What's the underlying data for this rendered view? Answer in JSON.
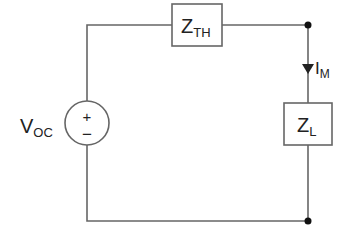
{
  "diagram": {
    "type": "circuit",
    "source": {
      "label_main": "V",
      "label_sub": "OC",
      "plus": "+",
      "minus": "−"
    },
    "series_impedance": {
      "label_main": "Z",
      "label_sub": "TH"
    },
    "load_impedance": {
      "label_main": "Z",
      "label_sub": "L"
    },
    "current": {
      "label_main": "I",
      "label_sub": "M",
      "direction": "down"
    },
    "colors": {
      "wire": "#555555",
      "text": "#222222",
      "node": "#111111"
    }
  }
}
